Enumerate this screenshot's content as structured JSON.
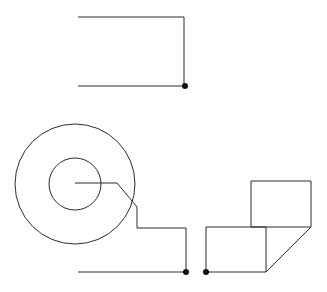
{
  "document": {
    "title": "Technical Line Drawing",
    "background_color": "#ffffff",
    "stroke_color": "#2b2b2b",
    "marker_color": "#111111",
    "width": 327,
    "height": 292
  },
  "drawing_data": {
    "type": "line-art",
    "description": "Monochrome vector line drawing: an open rectangle bracket at top, two concentric circles with a tangent tail at lower-left, and two offset squares joined by a diagonal at lower-right, with three small vertex dot markers.",
    "units": "px",
    "shapes": [
      {
        "id": "top-bracket",
        "name": "open-rectangle-bracket",
        "kind": "polyline",
        "closed": false,
        "points": [
          [
            78,
            17
          ],
          [
            184,
            17
          ],
          [
            184,
            86
          ],
          [
            78,
            86
          ]
        ]
      },
      {
        "id": "outer-circle",
        "name": "outer-circle",
        "kind": "circle",
        "cx": 75,
        "cy": 184,
        "r": 60
      },
      {
        "id": "inner-circle",
        "name": "inner-circle",
        "kind": "circle",
        "cx": 75,
        "cy": 184,
        "r": 26
      },
      {
        "id": "spiral-tail",
        "name": "center-tail-polyline",
        "kind": "polyline",
        "closed": false,
        "points": [
          [
            75,
            183
          ],
          [
            117,
            183
          ],
          [
            137,
            207
          ],
          [
            137,
            228
          ],
          [
            186,
            228
          ],
          [
            186,
            272
          ]
        ]
      },
      {
        "id": "baseline-left",
        "name": "lower-baseline",
        "kind": "polyline",
        "closed": false,
        "points": [
          [
            78,
            272
          ],
          [
            186,
            272
          ]
        ]
      },
      {
        "id": "lower-square",
        "name": "lower-left-square",
        "kind": "polyline",
        "closed": false,
        "points": [
          [
            206,
            227
          ],
          [
            206,
            272
          ],
          [
            266,
            272
          ],
          [
            266,
            227
          ],
          [
            206,
            227
          ]
        ]
      },
      {
        "id": "upper-square",
        "name": "upper-right-square",
        "kind": "polyline",
        "closed": false,
        "points": [
          [
            251,
            181
          ],
          [
            251,
            227
          ],
          [
            311,
            227
          ],
          [
            311,
            181
          ],
          [
            251,
            181
          ]
        ]
      },
      {
        "id": "diagonal-connector",
        "name": "diagonal-bevel",
        "kind": "polyline",
        "closed": false,
        "points": [
          [
            311,
            227
          ],
          [
            266,
            272
          ]
        ]
      }
    ],
    "markers": [
      {
        "id": "m1",
        "name": "vertex-marker-top-right",
        "x": 185,
        "y": 86,
        "r": 3
      },
      {
        "id": "m2",
        "name": "vertex-marker-bottom-center",
        "x": 186,
        "y": 272,
        "r": 3
      },
      {
        "id": "m3",
        "name": "vertex-marker-bottom-right",
        "x": 206,
        "y": 272,
        "r": 3
      }
    ]
  }
}
